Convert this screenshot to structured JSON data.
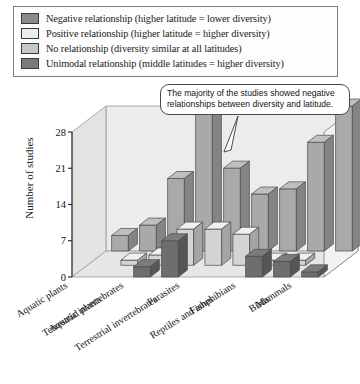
{
  "legend": {
    "items": [
      {
        "label": "Negative relationship (higher latitude = lower diversity)",
        "color": "#8b8b8b",
        "name": "negative"
      },
      {
        "label": "Positive relationship (higher latitude = higher diversity)",
        "color": "#e8e8e8",
        "name": "positive"
      },
      {
        "label": "No relationship (diversity similar at all latitudes)",
        "color": "#c6c6c6",
        "name": "no-relationship"
      },
      {
        "label": "Unimodal relationship (middle latitudes = higher diversity)",
        "color": "#7a7a7a",
        "name": "unimodal"
      }
    ]
  },
  "callout": {
    "text": "The majority of the studies showed negative relationships between diversity and latitude."
  },
  "chart_data": {
    "type": "bar",
    "title": "",
    "xlabel": "",
    "ylabel": "Number of studies",
    "ylim": [
      0,
      28
    ],
    "yticks": [
      0,
      7,
      14,
      21,
      28
    ],
    "grid": false,
    "legend_position": "top",
    "categories": [
      "Aquatic plants",
      "Terrestrial plants",
      "Aquatic invertebrates",
      "Terrestrial invertebrates",
      "Parasites",
      "Fishes",
      "Reptiles and amphibians",
      "Birds",
      "Mammals"
    ],
    "series": [
      {
        "name": "Negative relationship (higher latitude = lower diversity)",
        "color": "#a9a9a9",
        "values": [
          3,
          5,
          14,
          28,
          16,
          11,
          12,
          21,
          28
        ]
      },
      {
        "name": "Positive relationship (higher latitude = higher diversity)",
        "color": "#d4d4d4",
        "values": [
          0,
          1,
          2,
          7,
          7,
          6,
          1,
          1,
          0
        ]
      },
      {
        "name": "No relationship (diversity similar at all latitudes)",
        "color": "#c0c0c0",
        "values": [
          0,
          0,
          0,
          0,
          0,
          0,
          0,
          0,
          0
        ]
      },
      {
        "name": "Unimodal relationship (middle latitudes = higher diversity)",
        "color": "#6e6e6e",
        "values": [
          0,
          0,
          2,
          7,
          0,
          0,
          4,
          3,
          1
        ]
      }
    ]
  }
}
